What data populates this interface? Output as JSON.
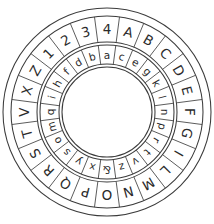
{
  "figure": {
    "kind": "cipher-wheel",
    "background_color": "#ffffff",
    "line_color": "#3b3b3b",
    "text_color": "#2b2b2b"
  },
  "geometry": {
    "center_x": 107,
    "center_y": 112,
    "outer_edge_radius": 104,
    "outer_ring_outer_radius": 96,
    "outer_ring_inner_radius": 70,
    "inner_ring_outer_radius": 67,
    "inner_ring_inner_radius": 48,
    "hub_radius": 45,
    "cell_count": 24,
    "outer_start_angle_deg": -82.5,
    "inner_start_angle_deg": -67.5
  },
  "outer_ring": {
    "name": "stationary-outer-ring",
    "count": 24,
    "cells": [
      "A",
      "B",
      "C",
      "D",
      "E",
      "F",
      "G",
      "I",
      "L",
      "M",
      "N",
      "O",
      "P",
      "Q",
      "R",
      "S",
      "T",
      "V",
      "X",
      "Z",
      "1",
      "2",
      "3",
      "4"
    ]
  },
  "inner_ring": {
    "name": "rotating-inner-ring",
    "count": 24,
    "cells": [
      "e",
      "g",
      "k",
      "l",
      "n",
      "p",
      "r",
      "t",
      "v",
      "z",
      "&",
      "x",
      "y",
      "s",
      "o",
      "m",
      "q",
      "i",
      "h",
      "f",
      "d",
      "b",
      "a",
      "c"
    ]
  }
}
